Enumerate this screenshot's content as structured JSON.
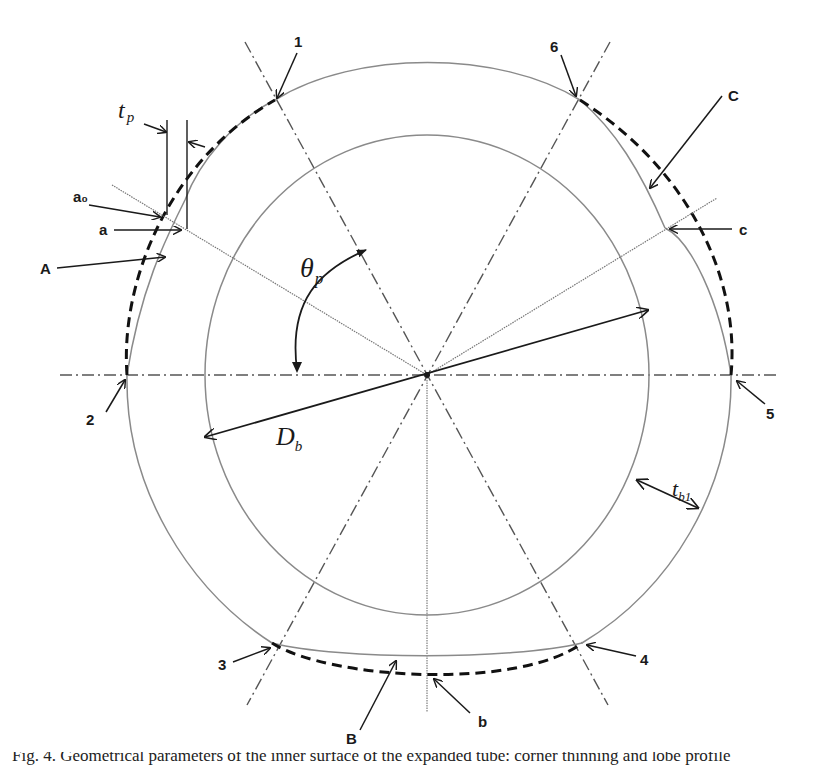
{
  "figure": {
    "type": "geometric-diagram",
    "center": {
      "x": 427,
      "y": 375
    },
    "point_labels": {
      "p1": "1",
      "p2": "2",
      "p3": "3",
      "p4": "4",
      "p5": "5",
      "p6": "6"
    },
    "region_labels": {
      "A": "A",
      "B": "B",
      "C": "C",
      "a": "a",
      "a0": "a₀",
      "b": "b",
      "c": "c"
    },
    "symbols": {
      "tp_base": "t",
      "tp_sub": "p",
      "theta_base": "θ",
      "theta_sub": "p",
      "Db_base": "D",
      "Db_sub": "b",
      "tb1_base": "t",
      "tb1_sub": "b1"
    },
    "colors": {
      "line_dark": "#1a1a1a",
      "line_gray": "#8a8a8a",
      "dashed": "#111111",
      "background": "#ffffff"
    }
  },
  "caption": {
    "text": "Fig. 4. Geometrical parameters of the inner surface of the expanded tube: corner thinning and lobe profile"
  }
}
